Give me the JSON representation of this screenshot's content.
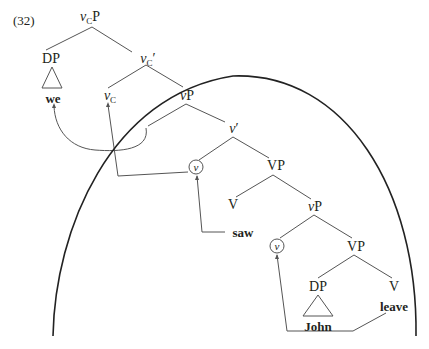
{
  "example_number": "(32)",
  "nodes": {
    "vcp": {
      "base": "v",
      "sub": "C",
      "tail": "P"
    },
    "dp_top": "DP",
    "we": "we",
    "vc_bar": {
      "base": "v",
      "sub": "C",
      "tail": "′"
    },
    "vc": {
      "base": "v",
      "sub": "C",
      "tail": ""
    },
    "vp_upper": {
      "base": "v",
      "tail": "P"
    },
    "v_bar": {
      "base": "v",
      "tail": "′"
    },
    "v_circled_upper": "v",
    "VP_upper": "VP",
    "V_upper": "V",
    "saw": "saw",
    "vp_lower": {
      "base": "v",
      "tail": "P"
    },
    "v_circled_lower": "v",
    "VP_lower": "VP",
    "dp_lower": "DP",
    "V_lower": "V",
    "leave": "leave",
    "john": "John"
  },
  "colors": {
    "ink": "#231f20",
    "branch": "#555555",
    "arc": "#222222"
  }
}
